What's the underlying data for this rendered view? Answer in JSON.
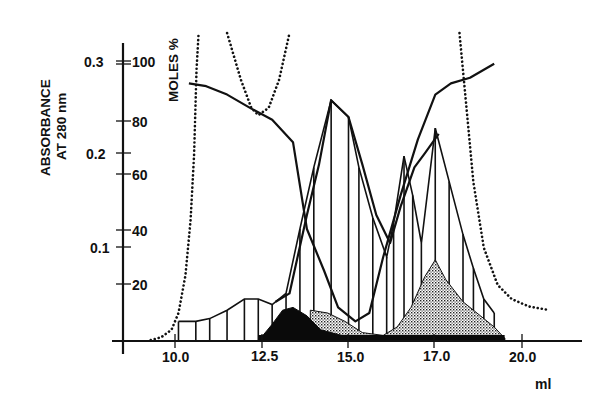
{
  "chart_data": {
    "type": "line",
    "title": "",
    "xlabel": "ml",
    "ylabel_left": "ABSORBANCE AT 280 nm",
    "ylabel_right": "MOLES %",
    "x_ticks": [
      {
        "label": "10.0",
        "value": 10.0
      },
      {
        "label": "12.5",
        "value": 12.5
      },
      {
        "label": "15.0",
        "value": 15.0
      },
      {
        "label": "17.0",
        "value": 17.5
      },
      {
        "label": "20.0",
        "value": 20.0
      }
    ],
    "y_left_ticks": [
      "0.1",
      "0.2",
      "0.3"
    ],
    "y_right_ticks": [
      "20",
      "40",
      "60",
      "80",
      "100"
    ],
    "xlim": [
      8.6,
      21.8
    ],
    "ylim_left": [
      0,
      0.3
    ],
    "ylim_right": [
      0,
      100
    ],
    "grid": false,
    "legend": "none",
    "series": [
      {
        "name": "Absorbance 280 nm (dotted)",
        "style": "dotted",
        "axis": "left",
        "points": [
          [
            9.3,
            0.001
          ],
          [
            9.6,
            0.004
          ],
          [
            9.9,
            0.012
          ],
          [
            10.1,
            0.03
          ],
          [
            10.3,
            0.07
          ],
          [
            10.45,
            0.13
          ],
          [
            10.55,
            0.2
          ],
          [
            10.62,
            0.29
          ],
          [
            10.68,
            0.33
          ],
          [
            11.5,
            0.33
          ],
          [
            11.9,
            0.28
          ],
          [
            12.2,
            0.25
          ],
          [
            12.4,
            0.242
          ],
          [
            12.7,
            0.25
          ],
          [
            13.0,
            0.28
          ],
          [
            13.3,
            0.33
          ],
          [
            18.2,
            0.33
          ],
          [
            18.4,
            0.25
          ],
          [
            18.6,
            0.17
          ],
          [
            18.9,
            0.1
          ],
          [
            19.3,
            0.06
          ],
          [
            19.7,
            0.045
          ],
          [
            20.2,
            0.037
          ],
          [
            20.8,
            0.033
          ]
        ]
      },
      {
        "name": "Moles % component A (descending)",
        "style": "solid",
        "axis": "right",
        "points": [
          [
            10.4,
            92
          ],
          [
            10.9,
            91
          ],
          [
            11.5,
            88
          ],
          [
            12.2,
            83
          ],
          [
            12.8,
            79
          ],
          [
            13.4,
            71
          ],
          [
            13.8,
            40
          ],
          [
            14.3,
            25
          ],
          [
            14.7,
            12
          ],
          [
            15.2,
            7
          ],
          [
            15.6,
            10
          ],
          [
            16.0,
            30
          ],
          [
            16.5,
            52
          ],
          [
            17.0,
            72
          ],
          [
            17.5,
            88
          ],
          [
            17.95,
            92
          ],
          [
            18.5,
            94
          ],
          [
            19.2,
            99
          ]
        ]
      },
      {
        "name": "Moles % component B (ascending)",
        "style": "solid",
        "axis": "right",
        "points": [
          [
            12.9,
            14
          ],
          [
            13.3,
            17
          ],
          [
            13.8,
            45
          ],
          [
            14.15,
            63
          ],
          [
            14.5,
            86
          ],
          [
            15.0,
            80
          ],
          [
            15.4,
            63
          ],
          [
            15.8,
            45
          ],
          [
            16.2,
            35
          ],
          [
            16.5,
            48
          ],
          [
            16.9,
            62
          ],
          [
            17.2,
            67
          ],
          [
            17.6,
            74
          ]
        ]
      },
      {
        "name": "Peak I (hatched)",
        "style": "vertical-hatch",
        "axis": "right",
        "points": [
          [
            10.1,
            7
          ],
          [
            10.6,
            7
          ],
          [
            11.0,
            8
          ],
          [
            11.5,
            11
          ],
          [
            12.0,
            15
          ],
          [
            12.4,
            15
          ],
          [
            12.8,
            13
          ],
          [
            13.2,
            17
          ],
          [
            13.6,
            40
          ],
          [
            14.0,
            62
          ],
          [
            14.5,
            86
          ],
          [
            15.0,
            80
          ],
          [
            15.3,
            62
          ],
          [
            15.7,
            44
          ],
          [
            16.1,
            30
          ],
          [
            16.3,
            42
          ],
          [
            16.6,
            66
          ],
          [
            16.85,
            52
          ],
          [
            17.1,
            35
          ],
          [
            17.5,
            76
          ],
          [
            17.9,
            57
          ],
          [
            18.3,
            38
          ],
          [
            18.6,
            26
          ],
          [
            18.9,
            15
          ],
          [
            19.2,
            10
          ]
        ]
      },
      {
        "name": "Peak II (solid black)",
        "style": "filled-black",
        "axis": "right",
        "points": [
          [
            12.4,
            0
          ],
          [
            12.8,
            6
          ],
          [
            13.1,
            11
          ],
          [
            13.4,
            12
          ],
          [
            13.8,
            9
          ],
          [
            14.2,
            4
          ],
          [
            14.8,
            2
          ],
          [
            15.5,
            1
          ],
          [
            19.5,
            1
          ]
        ]
      },
      {
        "name": "Peak III (stippled)",
        "style": "stippled",
        "axis": "right",
        "points": [
          [
            13.9,
            11
          ],
          [
            14.4,
            10
          ],
          [
            14.9,
            7
          ],
          [
            15.4,
            3
          ],
          [
            16.0,
            2
          ],
          [
            16.4,
            5
          ],
          [
            16.8,
            12
          ],
          [
            17.2,
            23
          ],
          [
            17.5,
            29
          ],
          [
            17.8,
            22
          ],
          [
            18.3,
            14
          ],
          [
            18.8,
            9
          ],
          [
            19.2,
            5
          ],
          [
            19.5,
            1
          ]
        ]
      }
    ]
  },
  "axes": {
    "left_title_line1": "ABSORBANCE",
    "left_title_line2": "AT 280 nm",
    "right_title": "MOLES %",
    "x_title": "ml"
  }
}
